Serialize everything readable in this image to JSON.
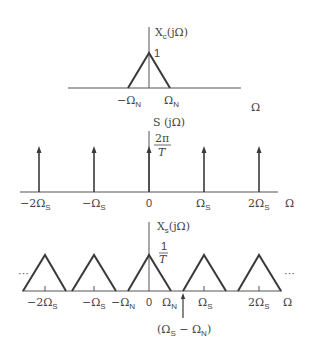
{
  "figure": {
    "colors": {
      "line": "#3a3a3a",
      "text": "#444444",
      "background": "#ffffff"
    },
    "top_plot": {
      "ylabel": "X",
      "ylabel_sub": "c",
      "ylabel_arg": "(jΩ)",
      "peak_label": "1",
      "ticks": [
        {
          "label": "−Ω",
          "sub": "N"
        },
        {
          "label": "Ω",
          "sub": "N"
        }
      ],
      "xlabel": "Ω"
    },
    "middle_plot": {
      "ylabel": "S (jΩ)",
      "amp_num": "2π",
      "amp_den": "T",
      "ticks": [
        {
          "label": "−2Ω",
          "sub": "S"
        },
        {
          "label": "−Ω",
          "sub": "S"
        },
        {
          "label": "0",
          "sub": ""
        },
        {
          "label": "Ω",
          "sub": "S"
        },
        {
          "label": "2Ω",
          "sub": "S"
        }
      ],
      "xlabel": "Ω"
    },
    "bottom_plot": {
      "ylabel": "X",
      "ylabel_sub": "s",
      "ylabel_arg": "(jΩ)",
      "amp_num": "1",
      "amp_den": "T",
      "ellipsis_left": "···",
      "ellipsis_right": "···",
      "ticks": [
        {
          "label": "−2Ω",
          "sub": "S"
        },
        {
          "label": "−Ω",
          "sub": "S"
        },
        {
          "label": "−Ω",
          "sub": "N"
        },
        {
          "label": "0",
          "sub": ""
        },
        {
          "label": "Ω",
          "sub": "N"
        },
        {
          "label": "Ω",
          "sub": "S"
        },
        {
          "label": "2Ω",
          "sub": "S"
        }
      ],
      "xlabel": "Ω",
      "annotation": {
        "open": "(Ω",
        "sub1": "S",
        "mid": " − Ω",
        "sub2": "N",
        "close": ")"
      }
    }
  }
}
